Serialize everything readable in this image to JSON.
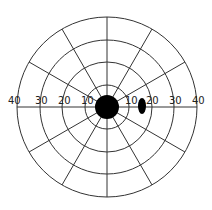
{
  "chart_data": {
    "type": "polar",
    "title": "",
    "rings": [
      10,
      20,
      30,
      40
    ],
    "ring_unit": "degrees",
    "radial_lines_deg": [
      0,
      30,
      60,
      90,
      120,
      150,
      180,
      210,
      240,
      270,
      300,
      330
    ],
    "axis_labels_left": [
      "40",
      "30",
      "20",
      "10"
    ],
    "axis_labels_right": [
      "10",
      "20",
      "30",
      "40"
    ],
    "features": [
      {
        "name": "central-scotoma",
        "shape": "circle",
        "center_deg": [
          0,
          0
        ],
        "radius_deg": 5
      },
      {
        "name": "blind-spot",
        "shape": "ellipse",
        "center_deg": [
          15,
          0
        ],
        "rx_deg": 1.5,
        "ry_deg": 3.5
      }
    ],
    "colors": {
      "lines": "#333333",
      "fill": "#000000",
      "background": "#ffffff"
    }
  },
  "labels": {
    "left": [
      "40",
      "30",
      "20",
      "10"
    ],
    "right": [
      "10",
      "20",
      "30",
      "40"
    ]
  }
}
